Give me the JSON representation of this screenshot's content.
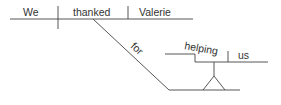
{
  "diagram": {
    "type": "Reed-Kellogg sentence diagram",
    "sentence": "We thanked Valerie for helping us",
    "subject": "We",
    "verb": "thanked",
    "direct_object": "Valerie",
    "preposition": "for",
    "gerund": "helping",
    "gerund_object": "us"
  }
}
